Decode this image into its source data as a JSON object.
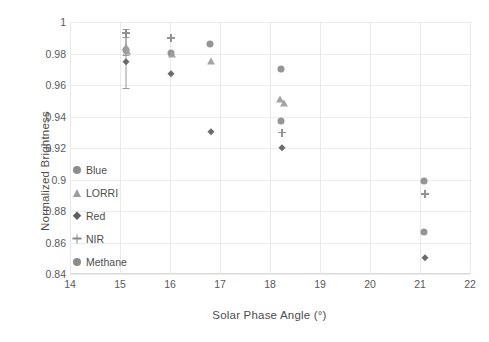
{
  "chart_data": {
    "type": "scatter",
    "title": "",
    "xlabel": "Solar Phase Angle (°)",
    "ylabel": "Normalized Brightness",
    "xlim": [
      14,
      22
    ],
    "ylim": [
      0.84,
      1.0
    ],
    "xticks": [
      14,
      15,
      16,
      17,
      18,
      19,
      20,
      21,
      22
    ],
    "xtick_labels": [
      "14",
      "15",
      "16",
      "17",
      "18",
      "19",
      "20",
      "21",
      "22"
    ],
    "yticks": [
      0.84,
      0.86,
      0.88,
      0.9,
      0.92,
      0.94,
      0.96,
      0.98,
      1.0
    ],
    "ytick_labels": [
      "0.84",
      "0.86",
      "0.88",
      "0.9",
      "0.92",
      "0.94",
      "0.96",
      "0.98",
      "1"
    ],
    "grid": "light vertical and horizontal gridlines",
    "legend_position": "inside lower-left of plot area",
    "series": [
      {
        "name": "Blue",
        "marker": "circle",
        "color": "#8c8c8c",
        "points": [
          {
            "x": 15.12,
            "y": 0.9825
          },
          {
            "x": 16.02,
            "y": 0.9805
          },
          {
            "x": 16.8,
            "y": 0.986
          },
          {
            "x": 18.22,
            "y": 0.97
          },
          {
            "x": 21.08,
            "y": 0.899
          }
        ]
      },
      {
        "name": "LORRI",
        "marker": "triangle",
        "color": "#9d9d9d",
        "points": [
          {
            "x": 15.12,
            "y": 0.984
          },
          {
            "x": 15.14,
            "y": 0.9815
          },
          {
            "x": 16.04,
            "y": 0.9795
          },
          {
            "x": 16.82,
            "y": 0.9752
          },
          {
            "x": 18.2,
            "y": 0.9512
          },
          {
            "x": 18.28,
            "y": 0.9485
          }
        ]
      },
      {
        "name": "Red",
        "marker": "diamond",
        "color": "#5e5e5e",
        "points": [
          {
            "x": 15.12,
            "y": 0.9745
          },
          {
            "x": 16.02,
            "y": 0.9672
          },
          {
            "x": 16.82,
            "y": 0.93
          },
          {
            "x": 18.24,
            "y": 0.9198
          },
          {
            "x": 21.1,
            "y": 0.85
          }
        ]
      },
      {
        "name": "NIR",
        "marker": "plus",
        "color": "#8a8a8a",
        "points": [
          {
            "x": 15.12,
            "y": 0.993
          },
          {
            "x": 16.02,
            "y": 0.99
          },
          {
            "x": 18.24,
            "y": 0.9298
          },
          {
            "x": 21.1,
            "y": 0.8908
          }
        ]
      },
      {
        "name": "Methane",
        "marker": "circle",
        "color": "#8c8c8c",
        "points": [
          {
            "x": 18.22,
            "y": 0.9372
          },
          {
            "x": 21.08,
            "y": 0.8668
          }
        ]
      }
    ],
    "error_bars": [
      {
        "x": 15.12,
        "y_low": 0.958,
        "y_high": 0.9955,
        "caps": true
      },
      {
        "x": 15.12,
        "y_low": 0.979,
        "y_high": 0.9905,
        "caps": true
      }
    ]
  },
  "legend": {
    "items": [
      {
        "label": "Blue",
        "marker": "circle"
      },
      {
        "label": "LORRI",
        "marker": "triangle"
      },
      {
        "label": "Red",
        "marker": "diamond"
      },
      {
        "label": "NIR",
        "marker": "plus"
      },
      {
        "label": "Methane",
        "marker": "circle"
      }
    ]
  }
}
